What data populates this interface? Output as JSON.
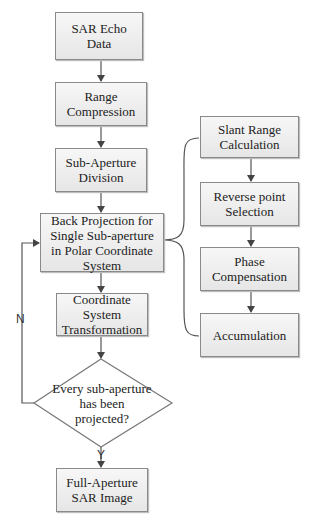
{
  "diagram": {
    "type": "flowchart",
    "main_flow": [
      {
        "id": "sar_echo",
        "label": "SAR Echo Data"
      },
      {
        "id": "range_comp",
        "label": "Range Compression"
      },
      {
        "id": "sub_div",
        "label": "Sub-Aperture Division"
      },
      {
        "id": "back_proj",
        "label": "Back Projection for Single Sub-aperture in Polar Coordinate System"
      },
      {
        "id": "coord_trans",
        "label": "Coordinate System Transformation"
      },
      {
        "id": "decision",
        "label": "Every sub-aperture has been projected?"
      },
      {
        "id": "full_ap",
        "label": "Full-Aperture SAR Image"
      }
    ],
    "sub_flow": [
      {
        "id": "slant",
        "label": "Slant Range Calculation"
      },
      {
        "id": "reverse",
        "label": "Reverse point Selection"
      },
      {
        "id": "phase",
        "label": "Phase Compensation"
      },
      {
        "id": "accum",
        "label": "Accumulation"
      }
    ],
    "labels": {
      "no": "N",
      "yes": "Y"
    },
    "colors": {
      "box_fill": "#ececec",
      "border": "#8a8a8a",
      "line": "#555555"
    }
  }
}
